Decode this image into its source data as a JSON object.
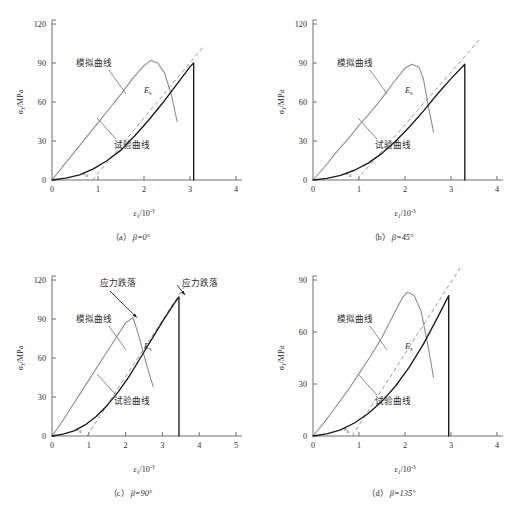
{
  "figure": {
    "background_color": "#ffffff",
    "sim_curve_color": "#8d8d8d",
    "test_curve_color": "#1a1a1a",
    "axis_color": "#6f6f6f",
    "dashed_color": "#9a9a9a",
    "labels": {
      "sim_curve": "模拟曲线",
      "test_curve": "试验曲线",
      "stress_drop": "应力跌落",
      "secant_modulus": "E",
      "secant_modulus_sub": "s",
      "eps0": "ε",
      "eps0_sub": "0"
    },
    "axis_titles": {
      "y_symbol": "σ",
      "y_sub": "1",
      "y_unit": "/MPa",
      "x_symbol": "ε",
      "x_sub": "1",
      "x_unit": "/10",
      "x_exp": "-3"
    }
  },
  "panels": [
    {
      "id": "panel-a",
      "caption_index": "（a）",
      "caption_beta": "β=0°",
      "y_ticks": [
        "0",
        "30",
        "60",
        "90",
        "120"
      ],
      "x_ticks": [
        "0",
        "1",
        "2",
        "3",
        "4"
      ],
      "y_max": 120,
      "x_max": 4,
      "eps0_value": 0.9,
      "annotations": []
    },
    {
      "id": "panel-b",
      "caption_index": "（b）",
      "caption_beta": "β=45°",
      "y_ticks": [
        "0",
        "30",
        "60",
        "90",
        "120"
      ],
      "x_ticks": [
        "0",
        "1",
        "2",
        "3",
        "4"
      ],
      "y_max": 120,
      "x_max": 4,
      "eps0_value": 0.95,
      "annotations": []
    },
    {
      "id": "panel-c",
      "caption_index": "（c）",
      "caption_beta": "β=90°",
      "y_ticks": [
        "0",
        "30",
        "60",
        "90",
        "120"
      ],
      "x_ticks": [
        "0",
        "1",
        "2",
        "3",
        "4",
        "5"
      ],
      "y_max": 120,
      "x_max": 5,
      "eps0_value": 0.95,
      "annotations": [
        "应力跌落",
        "应力跌落"
      ]
    },
    {
      "id": "panel-d",
      "caption_index": "（d）",
      "caption_beta": "β=135°",
      "y_ticks": [
        "0",
        "30",
        "60",
        "90"
      ],
      "x_ticks": [
        "0",
        "1",
        "2",
        "3",
        "4"
      ],
      "y_max": 90,
      "x_max": 4,
      "eps0_value": 0.9,
      "annotations": []
    }
  ],
  "chart_data": [
    {
      "type": "line",
      "title": "(a) β=0°",
      "xlabel": "ε1/10-3",
      "ylabel": "σ1/MPa",
      "xlim": [
        0,
        4
      ],
      "ylim": [
        0,
        120
      ],
      "grid": false,
      "legend": [
        "模拟曲线",
        "试验曲线"
      ],
      "series": [
        {
          "name": "模拟曲线",
          "x": [
            0,
            0.25,
            0.5,
            0.75,
            1.0,
            1.25,
            1.5,
            1.75,
            2.0,
            2.15,
            2.3,
            2.45,
            2.6,
            2.72
          ],
          "y": [
            0,
            11,
            22,
            33,
            44,
            55,
            66,
            78,
            88,
            92,
            90,
            82,
            65,
            45
          ]
        },
        {
          "name": "试验曲线",
          "x": [
            0,
            0.3,
            0.6,
            0.9,
            1.2,
            1.5,
            1.8,
            2.1,
            2.4,
            2.7,
            3.0,
            3.08,
            3.08
          ],
          "y": [
            0,
            1.5,
            4,
            8.5,
            15,
            23,
            34,
            46,
            59,
            73,
            87,
            90,
            0
          ]
        },
        {
          "name": "切线 (Es dashed)",
          "x": [
            0.88,
            3.3
          ],
          "y": [
            0,
            103
          ]
        }
      ]
    },
    {
      "type": "line",
      "title": "(b) β=45°",
      "xlabel": "ε1/10-3",
      "ylabel": "σ1/MPa",
      "xlim": [
        0,
        4
      ],
      "ylim": [
        0,
        120
      ],
      "grid": false,
      "legend": [
        "模拟曲线",
        "试验曲线"
      ],
      "series": [
        {
          "name": "模拟曲线",
          "x": [
            0,
            0.25,
            0.5,
            0.75,
            1.0,
            1.25,
            1.5,
            1.75,
            2.0,
            2.15,
            2.3,
            2.4,
            2.5,
            2.62
          ],
          "y": [
            0,
            10,
            21,
            31,
            42,
            52,
            63,
            75,
            86,
            89,
            87,
            78,
            58,
            37
          ]
        },
        {
          "name": "试验曲线",
          "x": [
            0,
            0.3,
            0.6,
            0.9,
            1.2,
            1.5,
            1.8,
            2.1,
            2.4,
            2.7,
            3.0,
            3.3,
            3.3
          ],
          "y": [
            0,
            1.2,
            3.5,
            7.5,
            13,
            20.5,
            30,
            41,
            53,
            66,
            78,
            89,
            0
          ]
        },
        {
          "name": "切线 (Es dashed)",
          "x": [
            0.95,
            3.62
          ],
          "y": [
            0,
            108
          ]
        }
      ]
    },
    {
      "type": "line",
      "title": "(c) β=90°",
      "xlabel": "ε1/10-3",
      "ylabel": "σ1/MPa",
      "xlim": [
        0,
        5
      ],
      "ylim": [
        0,
        120
      ],
      "grid": false,
      "legend": [
        "模拟曲线",
        "试验曲线"
      ],
      "annotations": [
        {
          "text": "应力跌落",
          "target_x": 2.25,
          "target_y": 88
        },
        {
          "text": "应力跌落",
          "target_x": 3.45,
          "target_y": 107
        }
      ],
      "series": [
        {
          "name": "模拟曲线",
          "x": [
            0,
            0.25,
            0.5,
            0.75,
            1.0,
            1.25,
            1.5,
            1.75,
            2.0,
            2.2,
            2.35,
            2.5,
            2.65,
            2.75
          ],
          "y": [
            0,
            10,
            21,
            32,
            43,
            54,
            65,
            76,
            87,
            91,
            78,
            62,
            47,
            38
          ]
        },
        {
          "name": "试验曲线",
          "x": [
            0,
            0.3,
            0.6,
            0.9,
            1.2,
            1.5,
            1.8,
            2.1,
            2.4,
            2.7,
            3.0,
            3.3,
            3.45,
            3.45
          ],
          "y": [
            0,
            1.5,
            4,
            8.5,
            15,
            23.5,
            34,
            46,
            60,
            74,
            88,
            101,
            107,
            0
          ]
        },
        {
          "name": "切线 (Es dashed)",
          "x": [
            0.95,
            3.62
          ],
          "y": [
            0,
            116
          ]
        }
      ]
    },
    {
      "type": "line",
      "title": "(d) β=135°",
      "xlabel": "ε1/10-3",
      "ylabel": "σ1/MPa",
      "xlim": [
        0,
        4
      ],
      "ylim": [
        0,
        90
      ],
      "grid": false,
      "legend": [
        "模拟曲线",
        "试验曲线"
      ],
      "series": [
        {
          "name": "模拟曲线",
          "x": [
            0,
            0.25,
            0.5,
            0.75,
            1.0,
            1.25,
            1.5,
            1.75,
            1.95,
            2.05,
            2.2,
            2.35,
            2.5,
            2.62
          ],
          "y": [
            0,
            8,
            17,
            26,
            36,
            46,
            57,
            70,
            80,
            83,
            81,
            72,
            52,
            34
          ]
        },
        {
          "name": "试验曲线",
          "x": [
            0,
            0.3,
            0.6,
            0.9,
            1.2,
            1.5,
            1.8,
            2.1,
            2.4,
            2.7,
            2.95,
            2.95
          ],
          "y": [
            0,
            1.2,
            3.5,
            7.5,
            13,
            20,
            29,
            40,
            53,
            68,
            81,
            0
          ]
        },
        {
          "name": "切线 (Es dashed)",
          "x": [
            0.85,
            3.2
          ],
          "y": [
            0,
            97
          ]
        }
      ]
    }
  ]
}
